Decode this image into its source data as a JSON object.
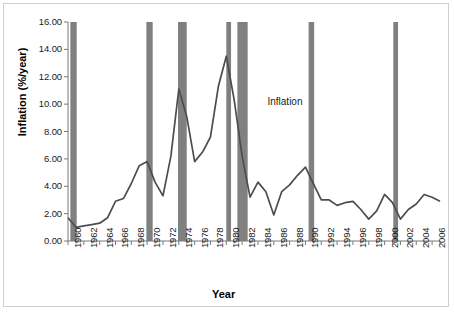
{
  "figure": {
    "axis_title_y": "Inflation (%/year)",
    "axis_title_x": "Year",
    "annotation": "Inflation",
    "annotation_x": 1985.2,
    "annotation_y": 10.1,
    "line_color": "#4d4d4d",
    "band_color": "#808080",
    "frame_color": "#d0d0d0",
    "axis_color": "#7a7a7a"
  },
  "chart_data": {
    "type": "line",
    "title": "",
    "subtitle": "",
    "xlabel": "Year",
    "ylabel": "Inflation (%/year)",
    "xlim": [
      1960,
      2007
    ],
    "ylim": [
      0.0,
      16.0
    ],
    "ytick_step": 2.0,
    "xtick_step_minor": 1,
    "xtick_step_major": 2,
    "grid": false,
    "legend": "none",
    "yticks": [
      "0.00",
      "2.00",
      "4.00",
      "6.00",
      "8.00",
      "10.00",
      "12.00",
      "14.00",
      "16.00"
    ],
    "xticks": [
      "1960",
      "1962",
      "1964",
      "1966",
      "1968",
      "1970",
      "1972",
      "1974",
      "1976",
      "1978",
      "1980",
      "1982",
      "1984",
      "1986",
      "1988",
      "1990",
      "1992",
      "1994",
      "1996",
      "1998",
      "2000",
      "2002",
      "2004",
      "2006"
    ],
    "series": [
      {
        "name": "Inflation",
        "x": [
          1960,
          1961,
          1962,
          1963,
          1964,
          1965,
          1966,
          1967,
          1968,
          1969,
          1970,
          1971,
          1972,
          1973,
          1974,
          1975,
          1976,
          1977,
          1978,
          1979,
          1980,
          1981,
          1982,
          1983,
          1984,
          1985,
          1986,
          1987,
          1988,
          1989,
          1990,
          1991,
          1992,
          1993,
          1994,
          1995,
          1996,
          1997,
          1998,
          1999,
          2000,
          2001,
          2002,
          2003,
          2004,
          2005,
          2006,
          2007
        ],
        "values": [
          1.7,
          1.0,
          1.1,
          1.2,
          1.3,
          1.7,
          2.9,
          3.1,
          4.2,
          5.5,
          5.8,
          4.3,
          3.3,
          6.2,
          11.1,
          9.1,
          5.8,
          6.5,
          7.6,
          11.3,
          13.5,
          10.3,
          6.2,
          3.2,
          4.3,
          3.6,
          1.9,
          3.6,
          4.1,
          4.8,
          5.4,
          4.2,
          3.0,
          3.0,
          2.6,
          2.8,
          2.9,
          2.3,
          1.6,
          2.2,
          3.4,
          2.8,
          1.6,
          2.3,
          2.7,
          3.4,
          3.2,
          2.9
        ]
      }
    ],
    "shaded_bands": [
      {
        "label": "recession-1960",
        "start": 1960.3,
        "end": 1961.1
      },
      {
        "label": "recession-1970",
        "start": 1969.9,
        "end": 1970.7
      },
      {
        "label": "recession-1974",
        "start": 1973.9,
        "end": 1975.0
      },
      {
        "label": "recession-1980",
        "start": 1980.0,
        "end": 1980.6
      },
      {
        "label": "recession-1982",
        "start": 1981.4,
        "end": 1982.7
      },
      {
        "label": "recession-1990",
        "start": 1990.4,
        "end": 1991.1
      },
      {
        "label": "recession-2001",
        "start": 2001.1,
        "end": 2001.7
      }
    ]
  }
}
